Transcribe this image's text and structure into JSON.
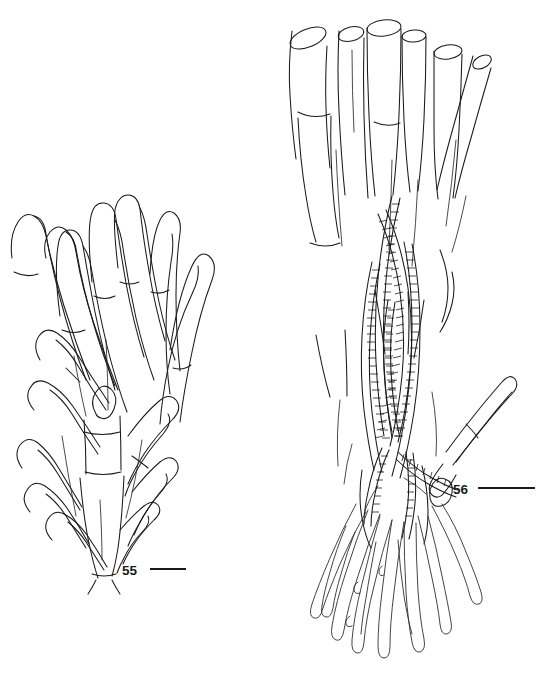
{
  "plate": {
    "background_color": "#ffffff",
    "ink_color": "#1a1a1a",
    "width": 550,
    "height": 675,
    "caption_text": ""
  },
  "figures": [
    {
      "id": "fig-55",
      "label": "55",
      "label_position": {
        "x": 122,
        "y": 575
      },
      "subject": "branched uniseriate filamentous thallus with septate clavate cells",
      "bounds": {
        "x": 8,
        "y": 198,
        "width": 196,
        "height": 392
      },
      "scalebar": {
        "x1": 150,
        "x2": 186,
        "y": 569,
        "length_px": 36
      }
    },
    {
      "id": "fig-56",
      "label": "56",
      "label_position": {
        "x": 453,
        "y": 494
      },
      "subject": "fascicle of wide open-ended tubular filaments with striated intertwined strands and basal rhizoids",
      "bounds": {
        "x": 282,
        "y": 10,
        "width": 258,
        "height": 655
      },
      "scalebar": {
        "x1": 478,
        "x2": 535,
        "y": 488,
        "length_px": 57
      }
    }
  ],
  "annotations": {
    "fig55_label": "55",
    "fig56_label": "56"
  }
}
